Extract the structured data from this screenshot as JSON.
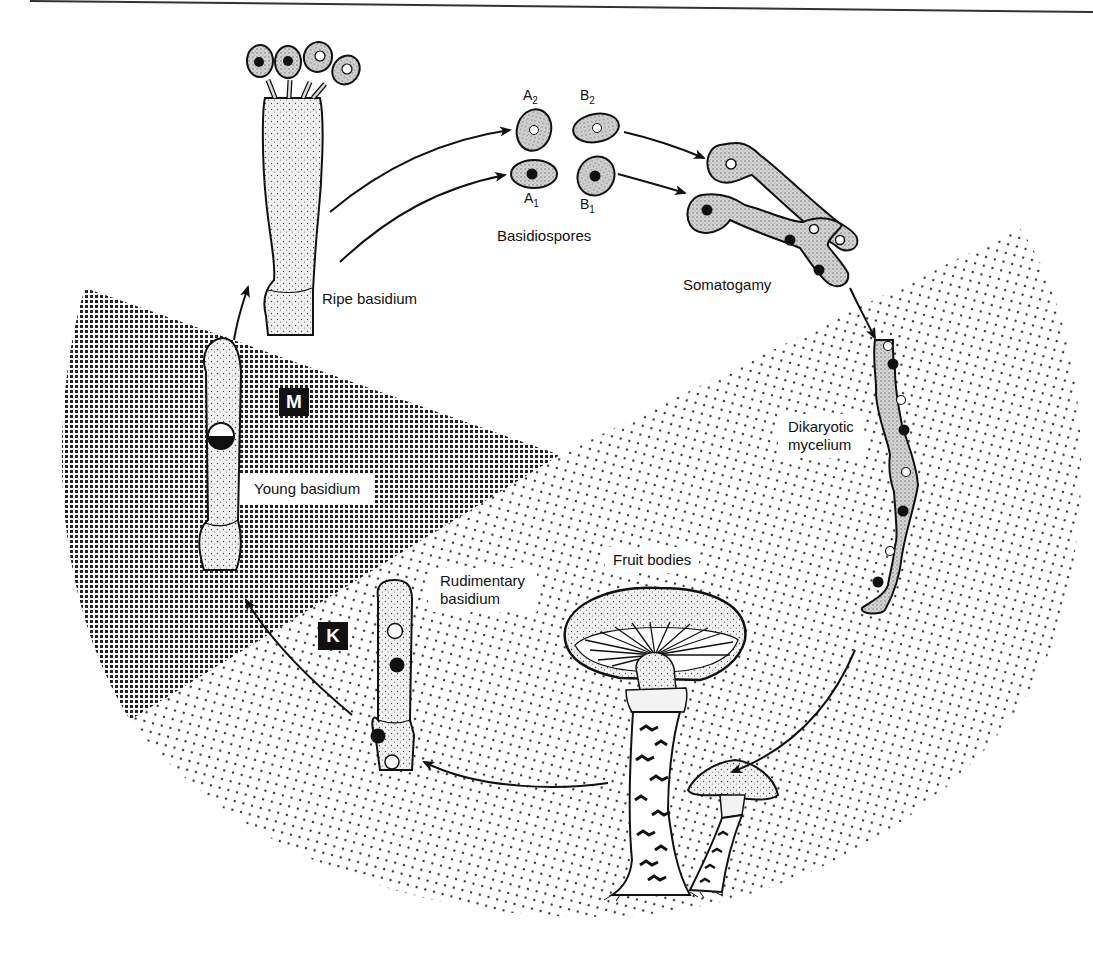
{
  "diagram": {
    "type": "life-cycle",
    "colors": {
      "ink": "#111111",
      "background": "#ffffff",
      "coarse_screen": "#222222",
      "fine_screen": "#333333",
      "cell_fill": "#d8d8d8"
    },
    "phase_markers": {
      "meiosis": "M",
      "karyogamy": "K"
    },
    "labels": {
      "ripe_basidium": "Ripe basidium",
      "basidiospores": "Basidiospores",
      "somatogamy": "Somatogamy",
      "dikaryotic_mycelium_line1": "Dikaryotic",
      "dikaryotic_mycelium_line2": "mycelium",
      "fruit_bodies": "Fruit bodies",
      "rudimentary_basidium_line1": "Rudimentary",
      "rudimentary_basidium_line2": "basidium",
      "young_basidium": "Young basidium"
    },
    "spores": [
      {
        "letter": "A",
        "index": "2",
        "nucleus": "white"
      },
      {
        "letter": "B",
        "index": "2",
        "nucleus": "white"
      },
      {
        "letter": "A",
        "index": "1",
        "nucleus": "black"
      },
      {
        "letter": "B",
        "index": "1",
        "nucleus": "black"
      }
    ],
    "flow": [
      "Young basidium",
      "Ripe basidium",
      "Basidiospores",
      "Somatogamy",
      "Dikaryotic mycelium",
      "Fruit bodies",
      "Rudimentary basidium",
      "Young basidium"
    ]
  }
}
